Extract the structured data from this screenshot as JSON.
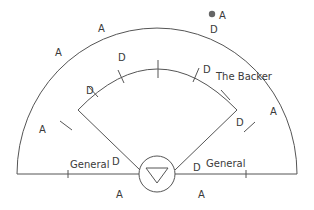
{
  "diagram": {
    "labels": {
      "outer_a_top": "A",
      "outer_a_upper_left": "A",
      "ball_a": "A",
      "d_top_right": "D",
      "d_inner_left_upper": "D",
      "d_inner_left": "D",
      "d_inner_right": "D",
      "the_backer": "The Backer",
      "a_left": "A",
      "a_right": "A",
      "d_right_corner": "D",
      "general_left": "General",
      "d_general_left": "D",
      "general_right": "General",
      "d_general_right": "D",
      "a_bottom_left": "A",
      "a_bottom_right": "A"
    },
    "colors": {
      "line": "#555555",
      "text": "#3a3a3a",
      "ball": "#666666"
    }
  }
}
